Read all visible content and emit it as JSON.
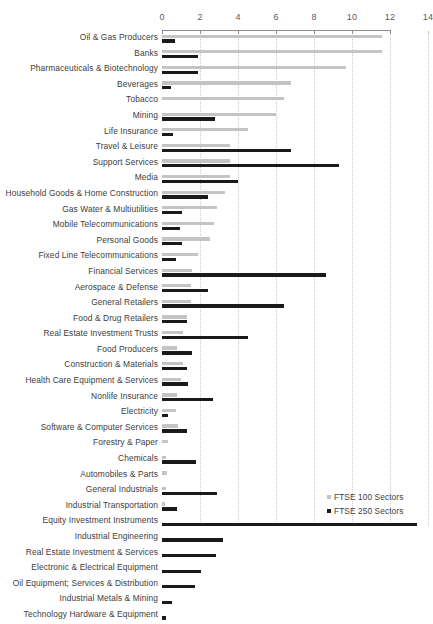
{
  "chart_data": {
    "type": "bar",
    "orientation": "horizontal",
    "title": "",
    "xlabel": "",
    "ylabel": "",
    "xlim": [
      0,
      14
    ],
    "xticks": [
      0,
      2,
      4,
      6,
      8,
      10,
      12,
      14
    ],
    "xtick_labels": [
      "0",
      "2",
      "4",
      "6",
      "8",
      "10",
      "12",
      "14"
    ],
    "minor_xticks": [
      1,
      3,
      5,
      7,
      9,
      11,
      13
    ],
    "grid": true,
    "grid_axis": "x",
    "legend_position": "bottom-right",
    "categories": [
      "Oil & Gas Producers",
      "Banks",
      "Pharmaceuticals & Biotechnology",
      "Beverages",
      "Tobacco",
      "Mining",
      "Life Insurance",
      "Travel & Leisure",
      "Support Services",
      "Media",
      "Household Goods & Home Construction",
      "Gas Water & Multiutilities",
      "Mobile Telecommunications",
      "Personal Goods",
      "Fixed Line Telecommunications",
      "Financial Services",
      "Aerospace & Defense",
      "General Retailers",
      "Food & Drug Retailers",
      "Real Estate Investment Trusts",
      "Food Producers",
      "Construction & Materials",
      "Health Care Equipment & Services",
      "Nonlife Insurance",
      "Electricity",
      "Software & Computer Services",
      "Forestry & Paper",
      "Chemicals",
      "Automobiles & Parts",
      "General Industrials",
      "Industrial Transportation",
      "Equity Investment Instruments",
      "Industrial Engineering",
      "Real Estate Investment & Services",
      "Electronic & Electrical Equipment",
      "Oil Equipment; Services & Distribution",
      "Industrial Metals & Mining",
      "Technology Hardware & Equipment"
    ],
    "series": [
      {
        "name": "FTSE 100 Sectors",
        "color": "#c4c4c4",
        "values": [
          11.6,
          11.6,
          9.7,
          6.8,
          6.4,
          6.0,
          4.5,
          3.6,
          3.6,
          3.6,
          3.3,
          2.9,
          2.75,
          2.5,
          1.9,
          1.6,
          1.5,
          1.5,
          1.3,
          1.1,
          0.8,
          1.1,
          1.0,
          0.8,
          0.75,
          0.85,
          0.3,
          0.2,
          0.25,
          0.2,
          0.15,
          0,
          0,
          0,
          0,
          0,
          0,
          0
        ]
      },
      {
        "name": "FTSE 250 Sectors",
        "color": "#1a1a1a",
        "values": [
          0.7,
          1.9,
          1.9,
          0.45,
          0,
          2.8,
          0.6,
          6.8,
          9.3,
          4.0,
          2.4,
          1.05,
          0.95,
          1.05,
          0.75,
          8.65,
          2.4,
          6.4,
          1.3,
          4.5,
          1.6,
          1.3,
          1.35,
          2.7,
          0.3,
          1.3,
          0,
          1.8,
          0,
          2.9,
          0.8,
          13.4,
          3.2,
          2.85,
          2.05,
          1.75,
          0.5,
          0.2
        ]
      }
    ]
  },
  "legend": {
    "items": [
      {
        "label": "FTSE 100 Sectors",
        "color": "#c4c4c4"
      },
      {
        "label": "FTSE 250 Sectors",
        "color": "#1a1a1a"
      }
    ]
  }
}
